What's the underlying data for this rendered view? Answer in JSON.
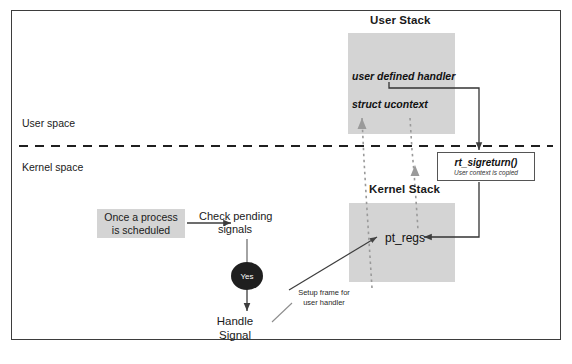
{
  "diagram": {
    "title_user_stack": "User Stack",
    "title_kernel_stack": "Kernel Stack",
    "regions": {
      "user_space": "User space",
      "kernel_space": "Kernel space"
    },
    "user_stack_entries": [
      "user defined handler",
      "struct ucontext"
    ],
    "kernel_stack_entries": [
      "pt_regs"
    ],
    "flow": {
      "start": "Once a process\nis scheduled",
      "check": "Check pending\nsignals",
      "decision": "Yes",
      "end": "Handle\nSignal"
    },
    "annotations": {
      "setup_frame": "Setup frame for\nuser handler"
    },
    "sigreturn": {
      "name": "rt_sigreturn()",
      "note": "User context is copied"
    },
    "colors": {
      "stack_fill": "#d4d4d4",
      "box_fill": "#d4d4d4",
      "decision_fill": "#1f1f1f",
      "line": "#3d3d3d",
      "border": "#3d3d3d",
      "text": "#1a1a1a"
    }
  }
}
